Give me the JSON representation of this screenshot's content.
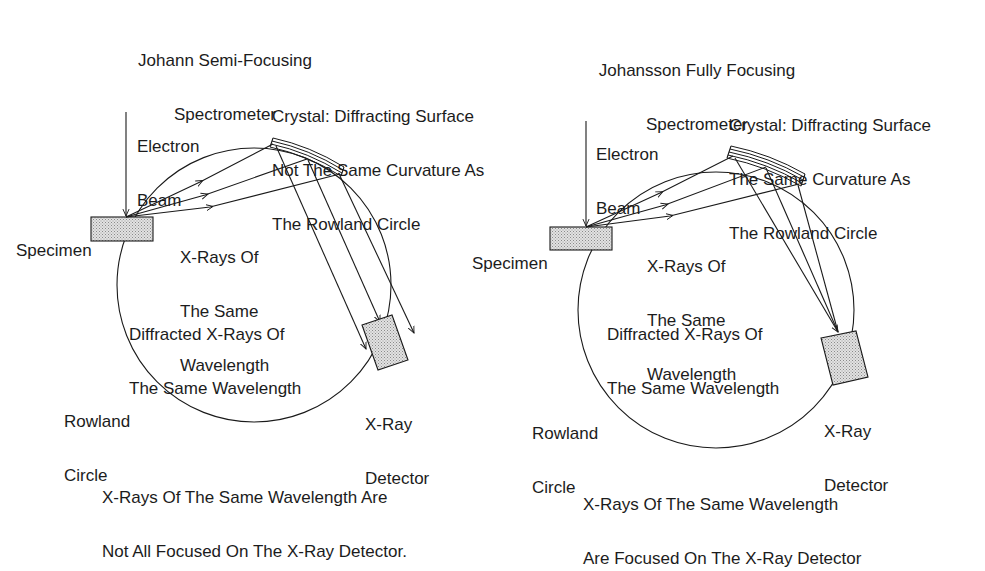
{
  "left_panel": {
    "title_line1": "Johann Semi-Focusing",
    "title_line2": "Spectrometer",
    "crystal_line1": "Crystal: Diffracting Surface",
    "crystal_line2": "Not The Same Curvature As",
    "crystal_line3": "The Rowland Circle",
    "electron_beam_line1": "Electron",
    "electron_beam_line2": "Beam",
    "specimen": "Specimen",
    "xrays_line1": "X-Rays Of",
    "xrays_line2": "The Same",
    "xrays_line3": "Wavelength",
    "diffracted_line1": "Diffracted X-Rays Of",
    "diffracted_line2": "The Same Wavelength",
    "rowland_line1": "Rowland",
    "rowland_line2": "Circle",
    "detector_line1": "X-Ray",
    "detector_line2": "Detector",
    "caption_line1": "X-Rays Of The Same Wavelength Are",
    "caption_line2": "Not All Focused On The X-Ray Detector."
  },
  "right_panel": {
    "title_line1": "Johansson Fully Focusing",
    "title_line2": "Spectrometer",
    "crystal_line1": "Crystal: Diffracting Surface",
    "crystal_line2": "The Same Curvature As",
    "crystal_line3": "The Rowland Circle",
    "electron_beam_line1": "Electron",
    "electron_beam_line2": "Beam",
    "specimen": "Specimen",
    "xrays_line1": "X-Rays Of",
    "xrays_line2": "The Same",
    "xrays_line3": "Wavelength",
    "diffracted_line1": "Diffracted X-Rays Of",
    "diffracted_line2": "The Same Wavelength",
    "rowland_line1": "Rowland",
    "rowland_line2": "Circle",
    "detector_line1": "X-Ray",
    "detector_line2": "Detector",
    "caption_line1": "X-Rays Of The Same Wavelength",
    "caption_line2": "Are Focused On The X-Ray Detector"
  },
  "colors": {
    "line": "#1a1a1a",
    "fill_stipple": "#cfcfcf",
    "background": "#ffffff"
  }
}
